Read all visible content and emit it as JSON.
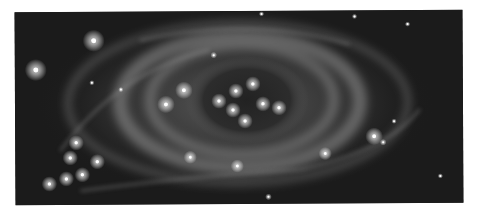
{
  "image": {
    "subject": "planetary nebula (grayscale astronomical photograph)",
    "palette": {
      "background": "#ffffff",
      "sky": "#1b1b1b",
      "nebula": "#8a8a8a",
      "core": "#2a2a2a",
      "star": "#ffffff"
    },
    "stars": [
      {
        "x": 94,
        "y": 40,
        "r": 5
      },
      {
        "x": 36,
        "y": 69,
        "r": 5
      },
      {
        "x": 184,
        "y": 90,
        "r": 4
      },
      {
        "x": 166,
        "y": 104,
        "r": 4
      },
      {
        "x": 236,
        "y": 91,
        "r": 3.5
      },
      {
        "x": 253,
        "y": 84,
        "r": 3.5
      },
      {
        "x": 219,
        "y": 101,
        "r": 3.5
      },
      {
        "x": 233,
        "y": 110,
        "r": 3.5
      },
      {
        "x": 263,
        "y": 104,
        "r": 3.5
      },
      {
        "x": 279,
        "y": 108,
        "r": 3.5
      },
      {
        "x": 245,
        "y": 121,
        "r": 3.5
      },
      {
        "x": 374,
        "y": 137,
        "r": 4
      },
      {
        "x": 76,
        "y": 142,
        "r": 3.5
      },
      {
        "x": 70,
        "y": 157,
        "r": 3.5
      },
      {
        "x": 97,
        "y": 161,
        "r": 3.5
      },
      {
        "x": 190,
        "y": 157,
        "r": 3
      },
      {
        "x": 237,
        "y": 166,
        "r": 3
      },
      {
        "x": 325,
        "y": 154,
        "r": 3
      },
      {
        "x": 82,
        "y": 174,
        "r": 3.5
      },
      {
        "x": 66,
        "y": 178,
        "r": 3.5
      },
      {
        "x": 49,
        "y": 183,
        "r": 3.5
      },
      {
        "x": 268,
        "y": 197,
        "r": 1.5
      },
      {
        "x": 383,
        "y": 143,
        "r": 1.5
      },
      {
        "x": 214,
        "y": 55,
        "r": 1.5
      },
      {
        "x": 92,
        "y": 82,
        "r": 1.2
      },
      {
        "x": 121,
        "y": 89,
        "r": 1.2
      },
      {
        "x": 262,
        "y": 14,
        "r": 1.2
      },
      {
        "x": 355,
        "y": 17,
        "r": 1.2
      },
      {
        "x": 408,
        "y": 25,
        "r": 1.2
      },
      {
        "x": 394,
        "y": 122,
        "r": 1.2
      },
      {
        "x": 440,
        "y": 177,
        "r": 1.2
      }
    ]
  }
}
